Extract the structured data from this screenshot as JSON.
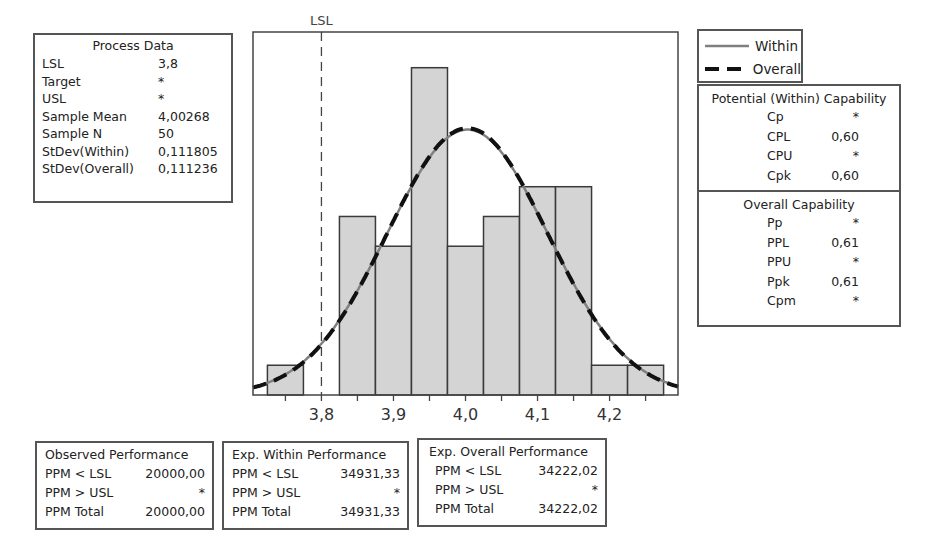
{
  "chart_data": {
    "type": "bar",
    "xlabel": "",
    "ylabel": "",
    "bin_width": 0.05,
    "bin_centers": [
      3.75,
      3.8,
      3.85,
      3.9,
      3.95,
      4.0,
      4.05,
      4.1,
      4.15,
      4.2,
      4.25
    ],
    "counts": [
      1,
      0,
      6,
      5,
      11,
      5,
      6,
      7,
      7,
      1,
      1
    ],
    "x_ticks": [
      3.75,
      3.8,
      3.85,
      3.9,
      3.95,
      4.0,
      4.05,
      4.1,
      4.15,
      4.2,
      4.25
    ],
    "x_tick_labels": [
      "",
      "3,8",
      "",
      "3,9",
      "",
      "4,0",
      "",
      "4,1",
      "",
      "4,2",
      ""
    ],
    "xlim": [
      3.705,
      4.295
    ],
    "ylim": [
      0,
      12.2
    ],
    "grid": false,
    "reference_lines": [
      {
        "label": "LSL",
        "x": 3.8,
        "style": "dashed"
      }
    ],
    "series": [
      {
        "name": "Within",
        "type": "normal_curve",
        "mean": 4.00268,
        "stdev": 0.111805,
        "style": "solid",
        "color": "#808080"
      },
      {
        "name": "Overall",
        "type": "normal_curve",
        "mean": 4.00268,
        "stdev": 0.111236,
        "style": "dashed",
        "color": "#111111"
      }
    ],
    "legend": {
      "position": "top-right",
      "entries": [
        "Within",
        "Overall"
      ]
    },
    "colors": {
      "bar_fill": "#d4d4d4",
      "bar_stroke": "#3a3a3a",
      "frame": "#444444"
    }
  },
  "process_data": {
    "title": "Process Data",
    "rows": [
      {
        "label": "LSL",
        "value": "3,8"
      },
      {
        "label": "Target",
        "value": "*"
      },
      {
        "label": "USL",
        "value": "*"
      },
      {
        "label": "Sample Mean",
        "value": "4,00268"
      },
      {
        "label": "Sample N",
        "value": "50"
      },
      {
        "label": "StDev(Within)",
        "value": "0,111805"
      },
      {
        "label": "StDev(Overall)",
        "value": "0,111236"
      }
    ]
  },
  "legend": {
    "within_label": "Within",
    "overall_label": "Overall"
  },
  "potential_capability": {
    "title": "Potential (Within) Capability",
    "rows": [
      {
        "label": "Cp",
        "value": "*"
      },
      {
        "label": "CPL",
        "value": "0,60"
      },
      {
        "label": "CPU",
        "value": "*"
      },
      {
        "label": "Cpk",
        "value": "0,60"
      }
    ]
  },
  "overall_capability": {
    "title": "Overall Capability",
    "rows": [
      {
        "label": "Pp",
        "value": "*"
      },
      {
        "label": "PPL",
        "value": "0,61"
      },
      {
        "label": "PPU",
        "value": "*"
      },
      {
        "label": "Ppk",
        "value": "0,61"
      },
      {
        "label": "Cpm",
        "value": "*"
      }
    ]
  },
  "observed_performance": {
    "title": "Observed Performance",
    "rows": [
      {
        "label": "PPM < LSL",
        "value": "20000,00"
      },
      {
        "label": "PPM > USL",
        "value": "*"
      },
      {
        "label": "PPM Total",
        "value": "20000,00"
      }
    ]
  },
  "exp_within_performance": {
    "title": "Exp. Within Performance",
    "rows": [
      {
        "label": "PPM < LSL",
        "value": "34931,33"
      },
      {
        "label": "PPM > USL",
        "value": "*"
      },
      {
        "label": "PPM Total",
        "value": "34931,33"
      }
    ]
  },
  "exp_overall_performance": {
    "title": "Exp. Overall Performance",
    "rows": [
      {
        "label": "PPM < LSL",
        "value": "34222,02"
      },
      {
        "label": "PPM > USL",
        "value": "*"
      },
      {
        "label": "PPM Total",
        "value": "34222,02"
      }
    ]
  }
}
